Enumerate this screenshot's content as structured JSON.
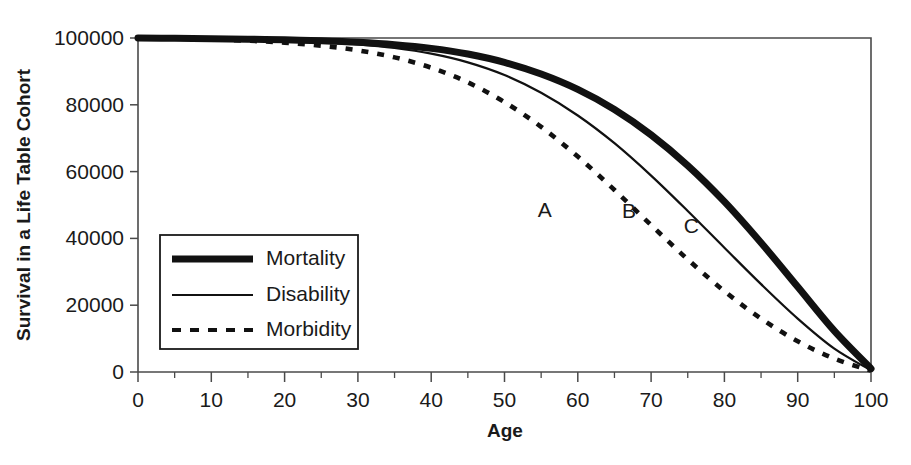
{
  "chart_data": {
    "type": "line",
    "title": "",
    "xlabel": "Age",
    "ylabel": "Survival in a Life Table Cohort",
    "xlim": [
      0,
      100
    ],
    "ylim": [
      0,
      100000
    ],
    "xticks": [
      0,
      10,
      20,
      30,
      40,
      50,
      60,
      70,
      80,
      90,
      100
    ],
    "xtick_labels": [
      "0",
      "10",
      "20",
      "30",
      "40",
      "50",
      "60",
      "70",
      "80",
      "90",
      "100"
    ],
    "xminor_step": 5,
    "yticks": [
      0,
      20000,
      40000,
      60000,
      80000,
      100000
    ],
    "ytick_labels": [
      "0",
      "20000",
      "40000",
      "60000",
      "80000",
      "100000"
    ],
    "grid": false,
    "legend_position": "lower-left-inside",
    "x": [
      0,
      5,
      10,
      15,
      20,
      25,
      30,
      35,
      40,
      45,
      50,
      55,
      60,
      65,
      70,
      75,
      80,
      85,
      90,
      95,
      100
    ],
    "series": [
      {
        "name": "Mortality",
        "style": "thick-solid",
        "color": "#111111",
        "annotation": "C",
        "values": [
          100000,
          99900,
          99800,
          99650,
          99450,
          99150,
          98700,
          98000,
          96900,
          95200,
          92700,
          89200,
          84600,
          78600,
          71000,
          61800,
          51000,
          38700,
          25500,
          12300,
          1000
        ]
      },
      {
        "name": "Disability",
        "style": "thin-solid",
        "color": "#111111",
        "annotation": "B",
        "values": [
          100000,
          99900,
          99750,
          99550,
          99250,
          98800,
          98100,
          97000,
          95300,
          92700,
          88900,
          83600,
          76800,
          68500,
          58800,
          48200,
          37200,
          26300,
          16000,
          7000,
          500
        ]
      },
      {
        "name": "Morbidity",
        "style": "dashed",
        "color": "#111111",
        "annotation": "A",
        "values": [
          100000,
          99850,
          99600,
          99200,
          98600,
          97700,
          96300,
          94200,
          91100,
          86700,
          80800,
          73400,
          64500,
          54500,
          44000,
          33700,
          24200,
          16000,
          9200,
          4000,
          400
        ]
      }
    ],
    "annotations": [
      {
        "label": "A",
        "x": 55.5,
        "y": 46500
      },
      {
        "label": "B",
        "x": 67.0,
        "y": 46000
      },
      {
        "label": "C",
        "x": 75.5,
        "y": 41500
      }
    ],
    "legend": [
      {
        "label": "Mortality",
        "style": "thick-solid"
      },
      {
        "label": "Disability",
        "style": "thin-solid"
      },
      {
        "label": "Morbidity",
        "style": "dashed"
      }
    ]
  }
}
